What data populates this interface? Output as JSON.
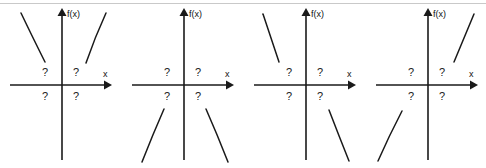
{
  "figure": {
    "panel_count": 4,
    "axis": {
      "y_label": "f(x)",
      "x_label": "x",
      "x_axis_name": "x-axis",
      "y_axis_name": "f-of-x-axis"
    },
    "quadrant_marks": {
      "top_left": "?",
      "top_right": "?",
      "bottom_left": "?",
      "bottom_right": "?"
    },
    "colors": {
      "ink": "#1a1a1a",
      "background": "#ffffff",
      "rule": "#c9c9c9"
    }
  },
  "panels": [
    {
      "id": "panel-1",
      "name": "both-ends-up",
      "left_branch": {
        "location": "upper-left",
        "direction": "rises-to-the-left"
      },
      "right_branch": {
        "location": "upper-right",
        "direction": "rises-to-the-right"
      }
    },
    {
      "id": "panel-2",
      "name": "both-ends-down",
      "left_branch": {
        "location": "lower-left",
        "direction": "falls-to-the-left"
      },
      "right_branch": {
        "location": "lower-right",
        "direction": "falls-to-the-right"
      }
    },
    {
      "id": "panel-3",
      "name": "up-left-down-right",
      "left_branch": {
        "location": "upper-left",
        "direction": "rises-to-the-left"
      },
      "right_branch": {
        "location": "lower-right",
        "direction": "falls-to-the-right"
      }
    },
    {
      "id": "panel-4",
      "name": "down-left-up-right",
      "left_branch": {
        "location": "lower-left",
        "direction": "falls-to-the-left"
      },
      "right_branch": {
        "location": "upper-right",
        "direction": "rises-to-the-right"
      }
    }
  ]
}
